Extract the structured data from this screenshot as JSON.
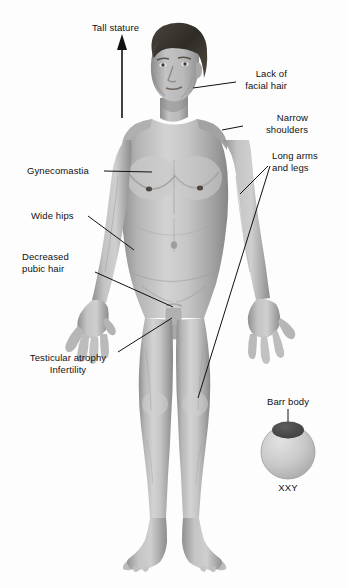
{
  "figure": {
    "background_color": "#fdfdfd",
    "skin_color": "#b9b9b9",
    "hair_color": "#3a3530",
    "line_color": "#111111"
  },
  "labels": [
    {
      "id": "tall-stature",
      "text": "Tall stature",
      "align": "left"
    },
    {
      "id": "lack-facial-hair",
      "line1": "Lack of",
      "line2": "facial hair",
      "align": "right"
    },
    {
      "id": "narrow-shoulders",
      "line1": "Narrow",
      "line2": "shoulders",
      "align": "right"
    },
    {
      "id": "long-arms-legs",
      "line1": "Long arms",
      "line2": "and legs",
      "align": "left"
    },
    {
      "id": "gynecomastia",
      "text": "Gynecomastia",
      "align": "left"
    },
    {
      "id": "wide-hips",
      "text": "Wide hips",
      "align": "left"
    },
    {
      "id": "decreased-pubic-hair",
      "line1": "Decreased",
      "line2": "pubic hair",
      "align": "left"
    },
    {
      "id": "testicular-atrophy",
      "line1": "Testicular atrophy",
      "line2": "Infertility",
      "align": "left"
    }
  ],
  "barr_body": {
    "label": "Barr body",
    "karyotype": "XXY",
    "nucleus_color": "#c9c9c9",
    "body_color": "#4a4a4a"
  }
}
